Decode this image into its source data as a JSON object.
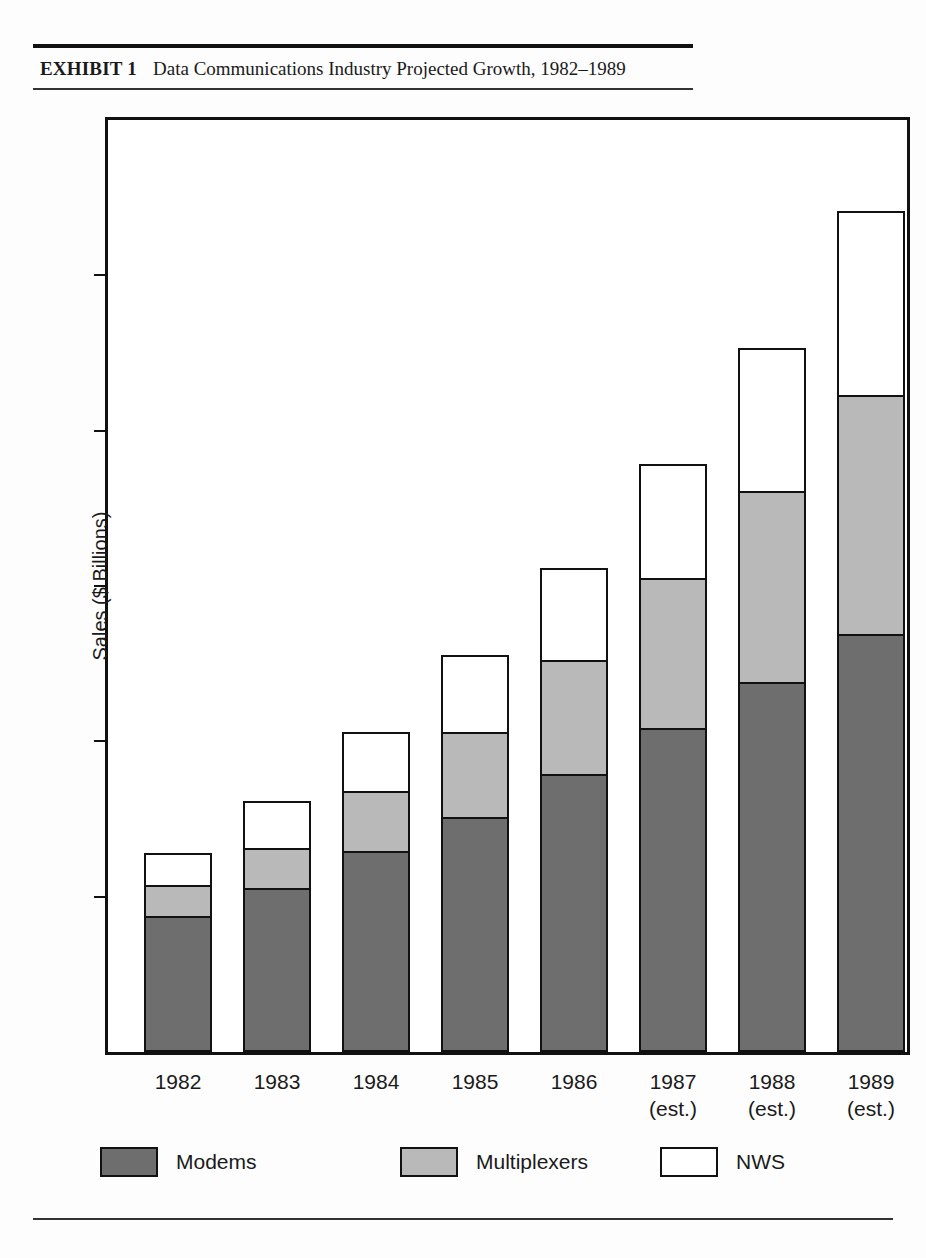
{
  "exhibit": {
    "label": "EXHIBIT 1",
    "title": "Data Communications Industry Projected Growth, 1982–1989"
  },
  "legend": {
    "position": "bottom",
    "items": [
      {
        "name": "Modems",
        "color": "#6e6e6e",
        "swatch": "modems"
      },
      {
        "name": "Multiplexers",
        "color": "#b9b9b9",
        "swatch": "mux"
      },
      {
        "name": "NWS",
        "color": "#ffffff",
        "swatch": "nws"
      }
    ]
  },
  "chart_data": {
    "type": "bar",
    "stacked": true,
    "title": "Data Communications Industry Projected Growth, 1982–1989",
    "xlabel": "",
    "ylabel": "Sales ($ Billions)",
    "ylim": [
      0,
      6
    ],
    "yticks": [
      0,
      1,
      2,
      3,
      4,
      5,
      6
    ],
    "ytick_labels": [
      "0",
      "1",
      "2",
      "3",
      "4",
      "5",
      "6"
    ],
    "grid": false,
    "categories": [
      "1982",
      "1983",
      "1984",
      "1985",
      "1986",
      "1987",
      "1988",
      "1989"
    ],
    "category_notes": [
      "",
      "",
      "",
      "",
      "",
      "(est.)",
      "(est.)",
      "(est.)"
    ],
    "series": [
      {
        "name": "Modems",
        "color": "#6e6e6e",
        "values": [
          0.86,
          1.04,
          1.28,
          1.5,
          1.78,
          2.07,
          2.37,
          2.68
        ]
      },
      {
        "name": "Multiplexers",
        "color": "#b9b9b9",
        "values": [
          0.2,
          0.26,
          0.39,
          0.55,
          0.73,
          0.97,
          1.23,
          1.54
        ]
      },
      {
        "name": "NWS",
        "color": "#ffffff",
        "values": [
          0.21,
          0.3,
          0.38,
          0.49,
          0.59,
          0.73,
          0.92,
          1.18
        ]
      }
    ],
    "totals": [
      1.27,
      1.6,
      2.05,
      2.54,
      3.1,
      3.77,
      4.52,
      5.4
    ]
  }
}
